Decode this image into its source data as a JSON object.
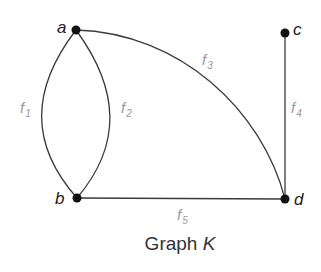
{
  "title": {
    "text": "Graph ",
    "italic": "K"
  },
  "vertices": [
    {
      "id": "a",
      "label": "a",
      "x": 76,
      "y": 30
    },
    {
      "id": "b",
      "label": "b",
      "x": 77,
      "y": 198
    },
    {
      "id": "c",
      "label": "c",
      "x": 285,
      "y": 33
    },
    {
      "id": "d",
      "label": "d",
      "x": 285,
      "y": 199
    }
  ],
  "edges": [
    {
      "id": "f1",
      "label": "f",
      "sub": "1",
      "from": "a",
      "to": "b"
    },
    {
      "id": "f2",
      "label": "f",
      "sub": "2",
      "from": "a",
      "to": "b"
    },
    {
      "id": "f3",
      "label": "f",
      "sub": "3",
      "from": "a",
      "to": "d"
    },
    {
      "id": "f4",
      "label": "f",
      "sub": "4",
      "from": "c",
      "to": "d"
    },
    {
      "id": "f5",
      "label": "f",
      "sub": "5",
      "from": "b",
      "to": "d"
    }
  ],
  "colors": {
    "edge": "#3a3a3a",
    "vertex": "#111111",
    "edge_label": "#9a9a9a"
  }
}
